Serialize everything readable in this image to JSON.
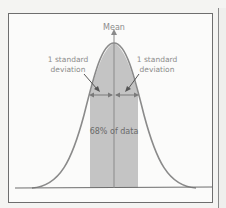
{
  "diagram": {
    "labels": {
      "mean": "Mean",
      "left_sd_line1": "1 standard",
      "left_sd_line2": "deviation",
      "right_sd_line1": "1 standard",
      "right_sd_line2": "deviation",
      "center": "68% of data"
    },
    "colors": {
      "curve": "#8a8a8a",
      "shaded_region": "#c4c4c4",
      "mean_line": "#8a8a8a",
      "arrows": "#7a7a7a",
      "baseline": "#6e6e6e",
      "frame": "#6e6e6e",
      "label_text": "#8c8c8c"
    },
    "shaded_percent": "68%",
    "shaded_range_sd": [
      -1,
      1
    ]
  }
}
